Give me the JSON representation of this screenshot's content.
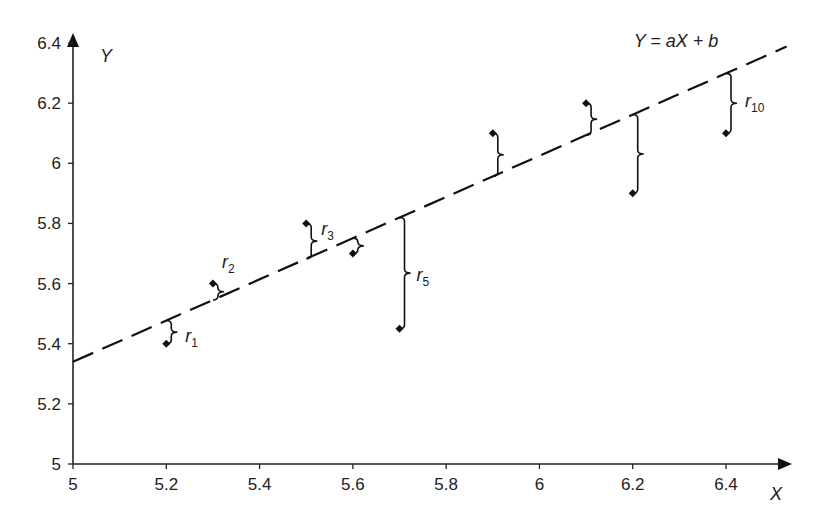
{
  "chart_data": {
    "type": "scatter",
    "title": "",
    "xlabel": "X",
    "ylabel": "Y",
    "xlim": [
      5,
      6.4
    ],
    "ylim": [
      5,
      6.4
    ],
    "x_ticks": [
      5,
      5.2,
      5.4,
      5.6,
      5.8,
      6,
      6.2,
      6.4
    ],
    "x_tick_labels": [
      "5",
      "5.2",
      "5.4",
      "5.6",
      "5.8",
      "6",
      "6.2",
      "6.4"
    ],
    "y_ticks": [
      5,
      5.2,
      5.4,
      5.6,
      5.8,
      6,
      6.2,
      6.4
    ],
    "y_tick_labels": [
      "5",
      "5.2",
      "5.4",
      "5.6",
      "5.8",
      "6",
      "6.2",
      "6.4"
    ],
    "grid": false,
    "series": [
      {
        "name": "observations",
        "x": [
          5.2,
          5.3,
          5.5,
          5.6,
          5.7,
          5.9,
          6.1,
          6.2,
          6.4
        ],
        "y": [
          5.4,
          5.6,
          5.8,
          5.7,
          5.45,
          6.1,
          6.2,
          5.9,
          6.1
        ]
      }
    ],
    "fit_line": {
      "label": "Y = aX + b",
      "style": "dashed",
      "slope": 0.685,
      "intercept": 1.915,
      "x_start": 5.0,
      "x_end": 6.53
    },
    "residual_labels": [
      {
        "text": "r",
        "sub": "1",
        "point_index": 0
      },
      {
        "text": "r",
        "sub": "2",
        "point_index": 1
      },
      {
        "text": "r",
        "sub": "3",
        "point_index": 2
      },
      {
        "text": "r",
        "sub": "5",
        "point_index": 4
      },
      {
        "text": "r",
        "sub": "10",
        "point_index": 8
      }
    ],
    "annotations": [
      "Y = aX + b",
      "r1",
      "r2",
      "r3",
      "r5",
      "r10"
    ]
  }
}
